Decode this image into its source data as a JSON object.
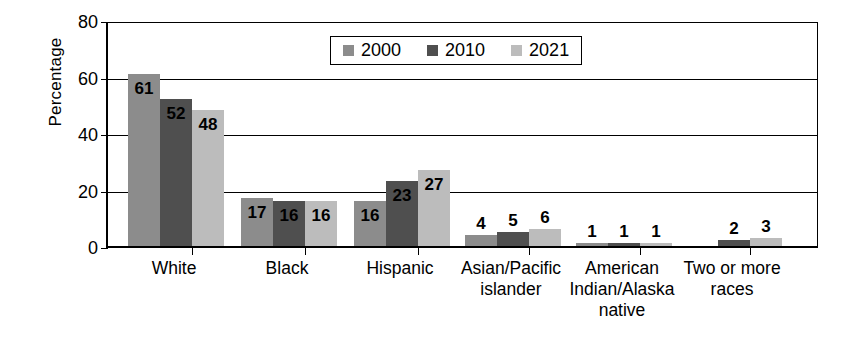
{
  "chart_data": {
    "type": "bar",
    "title": "",
    "xlabel": "",
    "ylabel": "Percentage",
    "ylim": [
      0,
      80
    ],
    "yticks": [
      0,
      20,
      40,
      60,
      80
    ],
    "ytick_labels": [
      "0",
      "20",
      "40",
      "60",
      "80"
    ],
    "grid": true,
    "legend_position": "top-center",
    "categories": [
      "White",
      "Black",
      "Hispanic",
      "Asian/Pacific\nislander",
      "American\nIndian/Alaska\nnative",
      "Two or more\nraces"
    ],
    "series": [
      {
        "name": "2000",
        "color": "#8c8c8c",
        "values": [
          61,
          17,
          16,
          4,
          1,
          null
        ]
      },
      {
        "name": "2010",
        "color": "#4f4f4f",
        "values": [
          52,
          16,
          23,
          5,
          1,
          2
        ]
      },
      {
        "name": "2021",
        "color": "#bcbcbc",
        "values": [
          48,
          16,
          27,
          6,
          1,
          3
        ]
      }
    ],
    "value_labels": [
      [
        "61",
        "52",
        "48"
      ],
      [
        "17",
        "16",
        "16"
      ],
      [
        "16",
        "23",
        "27"
      ],
      [
        "4",
        "5",
        "6"
      ],
      [
        "1",
        "1",
        "1"
      ],
      [
        "",
        "2",
        "3"
      ]
    ]
  },
  "legend": {
    "items": [
      {
        "label": "2000",
        "swatch": "2000-swatch"
      },
      {
        "label": "2010",
        "swatch": "2010-swatch"
      },
      {
        "label": "2021",
        "swatch": "2021-swatch"
      }
    ]
  },
  "axis": {
    "y_title": "Percentage"
  }
}
